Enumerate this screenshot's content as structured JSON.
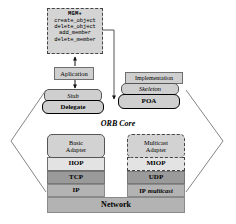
{
  "diagram": {
    "orb_core_label": "ORB Core",
    "colors": {
      "box_fill": "#cfcfcf",
      "adapter_fill": "#d2d2d2",
      "protocol_fill": "#e3e3e3",
      "transport_fill": "#9a9a9a",
      "network_fill": "#b3b3b3",
      "outline": "#000000",
      "dashed_outline": "#444444"
    }
  },
  "mgm": {
    "title": "MGM+",
    "operations": [
      "create_object",
      "delete_object",
      "add_member",
      "delete_member"
    ]
  },
  "client_side": {
    "application": "Aplication",
    "stub": "Stub",
    "delegate": "Delegate"
  },
  "server_side": {
    "implementation": "Implementation",
    "skeleton": "Skeleton",
    "poa": "POA"
  },
  "adapters": {
    "basic": {
      "line1": "Basic",
      "line2": "Adapter"
    },
    "multicast": {
      "line1": "Multicast",
      "line2": "Adapter"
    }
  },
  "protocol_stack": {
    "left": {
      "inter_orb": "IIOP",
      "transport": "TCP",
      "network": "IP"
    },
    "right": {
      "inter_orb": "MIOP",
      "transport": "UDP",
      "network_prefix": "IP",
      "network_suffix": "multicast"
    },
    "bottom": "Network"
  }
}
